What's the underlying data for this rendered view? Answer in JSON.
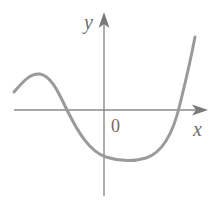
{
  "figure": {
    "colors": {
      "background": "#ffffff",
      "axis": "#8a8a8a",
      "curve": "#9a9a9a",
      "text": "#6e6e6e"
    },
    "labels": {
      "x_axis": "x",
      "y_axis": "y",
      "origin": "0"
    },
    "axes": {
      "x_axis": {
        "x1": 14,
        "y": 110,
        "x2": 198,
        "arrow_tip": 208
      },
      "y_axis": {
        "x": 104,
        "y1": 196,
        "y2": 22,
        "arrow_tip": 12
      }
    },
    "curve_points": [
      [
        14,
        92
      ],
      [
        38,
        74
      ],
      [
        67,
        110
      ],
      [
        104,
        156
      ],
      [
        122,
        161
      ],
      [
        177,
        110
      ],
      [
        195,
        37
      ]
    ],
    "curve_path": "M 14 92 C 26 78, 32 73, 40 74 C 52 76, 60 96, 68 112 C 78 132, 90 152, 106 157 C 118 161, 132 162, 146 158 C 164 152, 174 130, 180 104 C 186 80, 191 58, 195 37"
  }
}
